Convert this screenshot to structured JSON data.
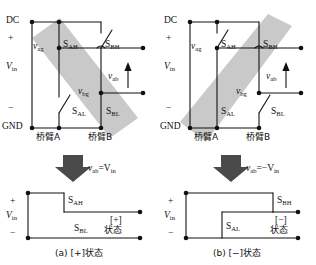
{
  "figure": {
    "caption_a": "(a) [+]状态",
    "caption_b": "(b) [−]状态"
  },
  "labels": {
    "dc": "DC",
    "gnd": "GND",
    "plus": "+",
    "minus": "−",
    "vin": "V",
    "vin_sub": "in",
    "v": "v",
    "ag_sub": "ag",
    "bg_sub": "bg",
    "ab_sub": "ab",
    "s": "S",
    "ah_sub": "AH",
    "al_sub": "AL",
    "bh_sub": "BH",
    "bl_sub": "BL",
    "arm_a": "桥臂A",
    "arm_b": "桥臂B",
    "state_word": "状态",
    "state_plus": "[+]",
    "state_minus": "[−]"
  },
  "panel_a": {
    "title": "[+] state",
    "equation_lead": "v",
    "equation_sub": "ab",
    "equation_tail": "=V",
    "equation_tail_sub": "in",
    "closed_switches": [
      "S_AH",
      "S_BL"
    ],
    "open_switches": [
      "S_AL",
      "S_BH"
    ],
    "output_label_top": "S",
    "output_label_top_sub": "AH",
    "output_label_bottom": "S",
    "output_label_bottom_sub": "BL",
    "state_tag": "[+]",
    "state_text": "状态"
  },
  "panel_b": {
    "title": "[−] state",
    "equation_lead": "v",
    "equation_sub": "ab",
    "equation_tail": "=−V",
    "equation_tail_sub": "in",
    "closed_switches": [
      "S_AL",
      "S_BH"
    ],
    "open_switches": [
      "S_AH",
      "S_BL"
    ],
    "output_label_top": "S",
    "output_label_top_sub": "BH",
    "output_label_bottom": "S",
    "output_label_bottom_sub": "AL",
    "state_tag": "[−]",
    "state_text": "状态"
  },
  "colors": {
    "line": "#111111",
    "highlight_band": "#c9c9c9",
    "arrow_fill": "#4a4a4a",
    "background": "#ffffff"
  }
}
